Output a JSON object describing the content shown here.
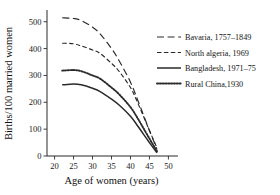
{
  "chart_data": {
    "type": "line",
    "title": "",
    "xlabel": "Age of women (years)",
    "ylabel": "Births/100 married women",
    "xlim": [
      18,
      52
    ],
    "ylim": [
      0,
      540
    ],
    "xticks": [
      20,
      25,
      30,
      35,
      40,
      45,
      50
    ],
    "yticks": [
      0,
      100,
      200,
      300,
      400,
      500
    ],
    "grid": false,
    "legend_position": "right",
    "x": [
      22,
      25,
      27,
      30,
      32,
      35,
      37,
      40,
      42,
      45,
      47
    ],
    "series": [
      {
        "name": "Bavaria, 1757–1849",
        "style": "long-dash",
        "color": "#2a2a2a",
        "values": [
          515,
          512,
          505,
          480,
          455,
          400,
          355,
          275,
          205,
          95,
          25
        ]
      },
      {
        "name": "North algeria, 1969",
        "style": "dash-dot",
        "color": "#2a2a2a",
        "values": [
          420,
          418,
          410,
          395,
          382,
          345,
          315,
          255,
          195,
          95,
          30
        ]
      },
      {
        "name": "Bangladesh, 1971–75",
        "style": "solid",
        "color": "#2a2a2a",
        "values": [
          265,
          268,
          265,
          252,
          240,
          212,
          190,
          148,
          110,
          50,
          12
        ]
      },
      {
        "name": "Rural China,1930",
        "style": "dotted",
        "color": "#b8b8b8",
        "values": [
          318,
          320,
          316,
          300,
          288,
          255,
          230,
          182,
          138,
          65,
          18
        ]
      }
    ]
  },
  "legend": {
    "entries": [
      {
        "label": "Bavaria, 1757–1849"
      },
      {
        "label": "North algeria, 1969"
      },
      {
        "label": "Bangladesh, 1971–75"
      },
      {
        "label": "Rural China,1930"
      }
    ]
  },
  "axes": {
    "x_title": "Age of women (years)",
    "y_title": "Births/100 married women"
  }
}
